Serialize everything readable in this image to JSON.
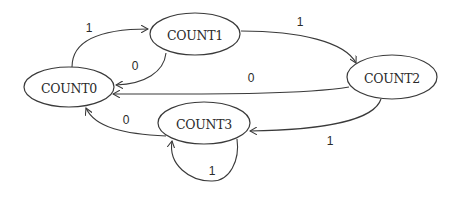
{
  "diagram": {
    "type": "state-machine",
    "states": [
      {
        "id": "count0",
        "label": "COUNT0",
        "cx": 69,
        "cy": 87,
        "rx": 45,
        "ry": 20
      },
      {
        "id": "count1",
        "label": "COUNT1",
        "cx": 195,
        "cy": 34,
        "rx": 45,
        "ry": 21
      },
      {
        "id": "count2",
        "label": "COUNT2",
        "cx": 392,
        "cy": 77,
        "rx": 45,
        "ry": 22
      },
      {
        "id": "count3",
        "label": "COUNT3",
        "cx": 204,
        "cy": 123,
        "rx": 46,
        "ry": 21
      }
    ],
    "transitions": [
      {
        "from": "COUNT0",
        "to": "COUNT1",
        "label": "1"
      },
      {
        "from": "COUNT1",
        "to": "COUNT0",
        "label": "0"
      },
      {
        "from": "COUNT1",
        "to": "COUNT2",
        "label": "1"
      },
      {
        "from": "COUNT2",
        "to": "COUNT0",
        "label": "0"
      },
      {
        "from": "COUNT2",
        "to": "COUNT3",
        "label": "1"
      },
      {
        "from": "COUNT3",
        "to": "COUNT0",
        "label": "0"
      },
      {
        "from": "COUNT3",
        "to": "COUNT3",
        "label": "1"
      }
    ]
  }
}
